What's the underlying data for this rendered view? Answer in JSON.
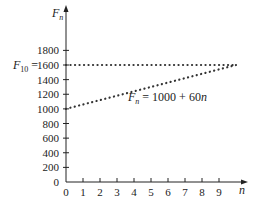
{
  "chart_data": {
    "type": "line",
    "title": "",
    "xlabel": "n",
    "ylabel": "F_n",
    "xlim": [
      0,
      10
    ],
    "ylim": [
      0,
      1900
    ],
    "x_ticks": [
      "0",
      "1",
      "2",
      "3",
      "4",
      "5",
      "6",
      "7",
      "8",
      "9"
    ],
    "y_ticks": [
      "0",
      "200",
      "400",
      "600",
      "800",
      "1000",
      "1200",
      "1400",
      "1600",
      "1800"
    ],
    "grid": false,
    "series": [
      {
        "name": "F_10 = 1600",
        "style": "dotted",
        "x": [
          0,
          10
        ],
        "values": [
          1600,
          1600
        ]
      },
      {
        "name": "F_n = 1000 + 60n",
        "style": "dotted",
        "x": [
          0,
          10
        ],
        "values": [
          1000,
          1600
        ]
      }
    ],
    "annotations": {
      "horizontal_label_main": "F",
      "horizontal_label_sub": "10",
      "horizontal_label_rest": " = 1600",
      "line_label_main": "F",
      "line_label_sub": "n",
      "line_label_rest": " = 1000 + 60n"
    },
    "axis_labels": {
      "y_main": "F",
      "y_sub": "n",
      "x": "n"
    }
  }
}
